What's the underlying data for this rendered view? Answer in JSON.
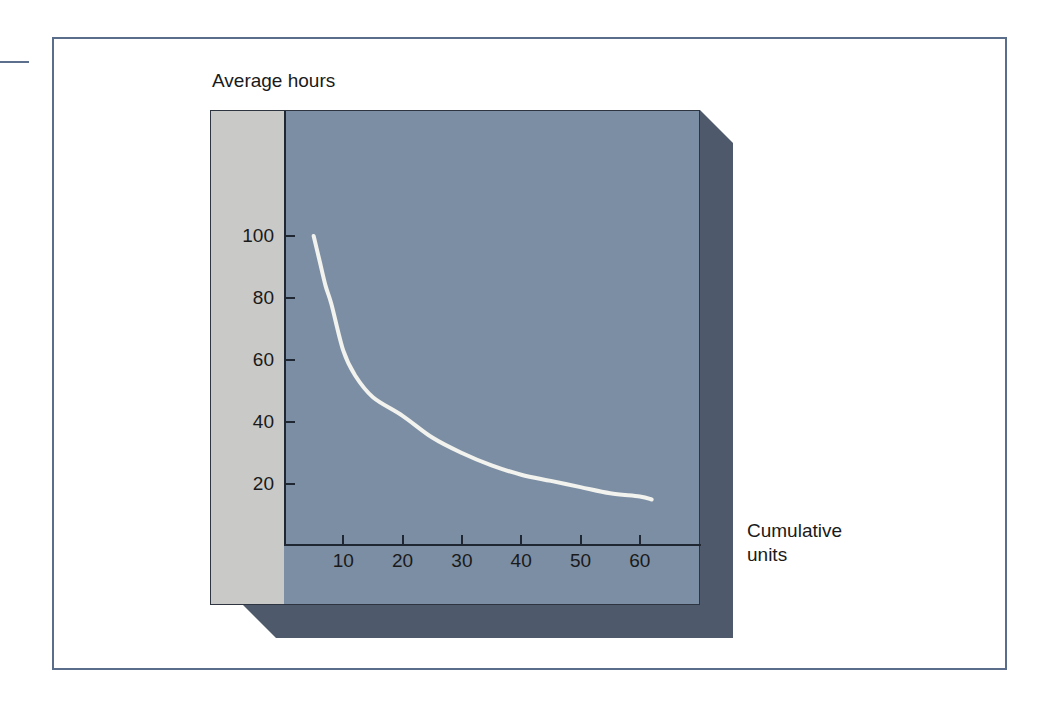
{
  "figure": {
    "y_axis_title": "Average hours",
    "x_axis_title_line1": "Cumulative",
    "x_axis_title_line2": "units"
  },
  "colors": {
    "plot_field": "#7c8ea3",
    "panel_margin": "#c9c9c7",
    "panel_shadow": "#4e5a6b",
    "curve": "#f2f2ee",
    "frame_border": "#5a6d8a",
    "axis": "#1f2733",
    "text": "#1a1a1a"
  },
  "chart_data": {
    "type": "line",
    "title": "",
    "subtitle": "",
    "xlabel": "Cumulative units",
    "ylabel": "Average hours",
    "xlim": [
      0,
      70
    ],
    "ylim": [
      0,
      110
    ],
    "xticks": [
      10,
      20,
      30,
      40,
      50,
      60
    ],
    "yticks": [
      20,
      40,
      60,
      80,
      100
    ],
    "xtick_labels": [
      "10",
      "20",
      "30",
      "40",
      "50",
      "60"
    ],
    "ytick_labels": [
      "20",
      "40",
      "60",
      "80",
      "100"
    ],
    "grid": false,
    "legend": "none",
    "annotations": [],
    "series": [
      {
        "name": "Learning curve",
        "color": "#f2f2ee",
        "linewidth": 4,
        "x": [
          5,
          6,
          7,
          8,
          10,
          12,
          15,
          20,
          25,
          30,
          35,
          40,
          45,
          50,
          55,
          60,
          62
        ],
        "y": [
          100,
          92,
          84,
          78,
          63,
          55,
          48,
          42,
          35,
          30,
          26,
          23,
          21,
          19,
          17,
          16,
          15
        ]
      }
    ]
  }
}
